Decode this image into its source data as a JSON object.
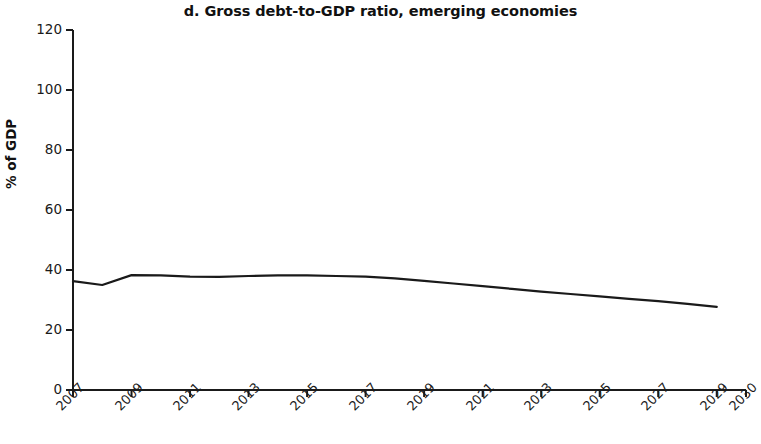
{
  "chart_data": {
    "type": "line",
    "title": "d. Gross debt-to-GDP ratio, emerging economies",
    "xlabel": "",
    "ylabel": "% of GDP",
    "ylim": [
      0,
      120
    ],
    "ytick_values": [
      0,
      20,
      40,
      60,
      80,
      100,
      120
    ],
    "ytick_labels": [
      "0",
      "20",
      "40",
      "60",
      "80",
      "100",
      "120"
    ],
    "xlim": [
      2007,
      2030
    ],
    "xtick_values": [
      2007,
      2009,
      2011,
      2013,
      2015,
      2017,
      2019,
      2021,
      2023,
      2025,
      2027,
      2029,
      2030
    ],
    "xtick_labels": [
      "2007",
      "2009",
      "2011",
      "2013",
      "2015",
      "2017",
      "2019",
      "2021",
      "2023",
      "2025",
      "2027",
      "2029",
      "2030"
    ],
    "xtick_rotation": -45,
    "grid": false,
    "legend": false,
    "legend_position": "none",
    "line_color": "#1a1a1a",
    "line_width": 2.2,
    "series": [
      {
        "name": "Gross debt-to-GDP ratio, emerging economies",
        "x": [
          2007,
          2008,
          2009,
          2010,
          2011,
          2012,
          2013,
          2014,
          2015,
          2016,
          2017,
          2018,
          2019,
          2020,
          2021,
          2022,
          2023,
          2024,
          2025,
          2026,
          2027,
          2028,
          2029
        ],
        "values": [
          36.3,
          35.0,
          38.3,
          38.2,
          37.8,
          37.7,
          38.0,
          38.2,
          38.2,
          38.0,
          37.8,
          37.2,
          36.4,
          35.5,
          34.6,
          33.7,
          32.8,
          32.0,
          31.2,
          30.4,
          29.6,
          28.7,
          27.7
        ]
      }
    ]
  },
  "axes": {
    "y_title": "% of GDP",
    "y_labels": [
      "120",
      "100",
      "80",
      "60",
      "40",
      "20",
      "0"
    ],
    "x_labels": [
      "2007",
      "2009",
      "2011",
      "2013",
      "2015",
      "2017",
      "2019",
      "2021",
      "2023",
      "2025",
      "2027",
      "2029",
      "2030"
    ]
  },
  "title": {
    "text": "d. Gross debt-to-GDP ratio, emerging economies"
  }
}
